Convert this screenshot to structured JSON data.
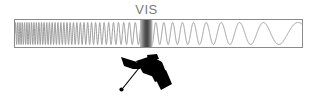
{
  "figure": {
    "title": "",
    "background_color": "#ffffff",
    "spectrum_bar": {
      "x": 14,
      "y": 19,
      "width": 289,
      "height": 29,
      "border_color": "#8a8a8a",
      "border_width": 1,
      "fill_color": "#ffffff"
    },
    "waveform": {
      "name": "electromagnetic-wave",
      "stroke_color": "#9a9a9a",
      "stroke_width": 1,
      "description": "sine wave with wavelength increasing from left to right",
      "short_wavelength_px": 2.2,
      "long_wavelength_px": 46,
      "amplitude_px": 11
    },
    "visible_band": {
      "label": "VIS",
      "label_color": "#7a7a7a",
      "x": 140,
      "width": 12,
      "gradient_edge_color": "#b9b9b9",
      "gradient_center_color": "#4a4a4a"
    },
    "satellite": {
      "name": "satellite-icon",
      "color": "#000000",
      "x": 118,
      "y": 55,
      "width": 54,
      "height": 40
    }
  },
  "chart_data": {
    "type": "line",
    "title": "",
    "subtitle": "",
    "xlabel": "",
    "ylabel": "",
    "annotations": [
      "VIS"
    ],
    "legend": [],
    "grid": false,
    "categories": [
      "short wavelength",
      "VIS",
      "long wavelength"
    ],
    "values": [
      1,
      2,
      3
    ],
    "series": [
      {
        "name": "wavelength",
        "x": [
          0,
          0.1,
          0.2,
          0.3,
          0.4,
          0.44,
          0.5,
          0.6,
          0.7,
          0.8,
          0.9,
          1.0
        ],
        "values": [
          2.2,
          5,
          9,
          14,
          19,
          21,
          24,
          30,
          36,
          40,
          44,
          46
        ]
      }
    ],
    "xlim": [
      0,
      1
    ],
    "ylim": [
      0,
      50
    ]
  }
}
